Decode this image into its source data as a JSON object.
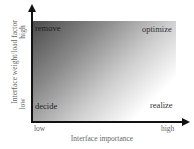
{
  "diagram": {
    "quadrants": {
      "top_left": "remove",
      "top_right": "optimize",
      "bottom_left": "decide",
      "bottom_right": "realize"
    },
    "x_axis": {
      "label": "Interface importance",
      "low": "low",
      "high": "high"
    },
    "y_axis": {
      "label": "Interface weight/load factor",
      "low": "low",
      "high": "high"
    },
    "colors": {
      "gradient_dark": "#4a4a4a",
      "gradient_light": "#ffffff",
      "axis": "#111111"
    }
  }
}
